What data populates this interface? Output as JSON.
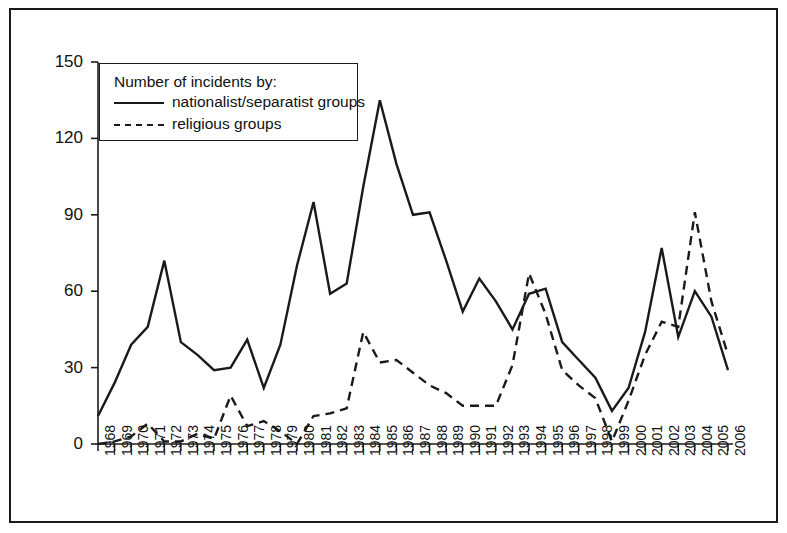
{
  "chart_data": {
    "type": "line",
    "title": "",
    "xlabel": "",
    "ylabel": "",
    "ylim": [
      0,
      150
    ],
    "yticks": [
      0,
      30,
      60,
      90,
      120,
      150
    ],
    "grid": false,
    "legend_position": "top-left",
    "legend_title": "Number of incidents by:",
    "categories": [
      "1968",
      "1969",
      "1970",
      "1971",
      "1972",
      "1973",
      "1974",
      "1975",
      "1976",
      "1977",
      "1978",
      "1979",
      "1980",
      "1981",
      "1982",
      "1983",
      "1984",
      "1985",
      "1986",
      "1987",
      "1988",
      "1989",
      "1990",
      "1991",
      "1992",
      "1993",
      "1994",
      "1995",
      "1996",
      "1997",
      "1998",
      "1999",
      "2000",
      "2001",
      "2002",
      "2003",
      "2004",
      "2005",
      "2006"
    ],
    "series": [
      {
        "name": "nationalist/separatist groups",
        "style": "solid",
        "color": "#1a1a1a",
        "values": [
          11,
          24,
          39,
          46,
          72,
          40,
          35,
          29,
          30,
          41,
          22,
          39,
          70,
          95,
          59,
          63,
          101,
          135,
          110,
          90,
          91,
          72,
          52,
          65,
          56,
          45,
          59,
          61,
          40,
          33,
          26,
          13,
          22,
          44,
          77,
          42,
          60,
          50,
          29
        ]
      },
      {
        "name": "religious groups",
        "style": "dashed",
        "color": "#1a1a1a",
        "values": [
          0,
          1,
          3,
          8,
          1,
          1,
          4,
          2,
          19,
          7,
          9,
          5,
          0,
          11,
          12,
          14,
          44,
          32,
          33,
          28,
          23,
          20,
          15,
          15,
          15,
          31,
          67,
          51,
          29,
          23,
          18,
          1,
          17,
          35,
          48,
          46,
          91,
          56,
          35
        ]
      }
    ]
  },
  "axis": {
    "y_tick_labels": [
      "150",
      "120",
      "90",
      "60",
      "30",
      "0"
    ]
  },
  "legend": {
    "title": "Number of incidents by:",
    "items": [
      {
        "label": "nationalist/separatist groups",
        "style": "solid"
      },
      {
        "label": "religious groups",
        "style": "dashed"
      }
    ]
  }
}
